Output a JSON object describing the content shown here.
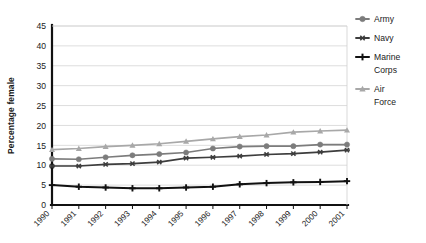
{
  "chart_data": {
    "type": "line",
    "title": "",
    "xlabel": "",
    "ylabel": "Percentage female",
    "ylim": [
      0,
      45
    ],
    "ytick_step": 5,
    "yticks": [
      0,
      5,
      10,
      15,
      20,
      25,
      30,
      35,
      40,
      45
    ],
    "grid": "horizontal",
    "legend_position": "right",
    "categories": [
      "1990",
      "1991",
      "1992",
      "1993",
      "1994",
      "1995",
      "1996",
      "1997",
      "1998",
      "1999",
      "2000",
      "2001"
    ],
    "series": [
      {
        "name": "Army",
        "color": "#7c7c7c",
        "marker": "circle",
        "values": [
          11.6,
          11.5,
          12.0,
          12.5,
          12.8,
          13.2,
          14.2,
          14.7,
          14.8,
          14.8,
          15.2,
          15.2
        ]
      },
      {
        "name": "Navy",
        "color": "#3d3d3d",
        "marker": "asterisk",
        "values": [
          9.8,
          9.8,
          10.2,
          10.4,
          10.8,
          11.8,
          12.0,
          12.3,
          12.7,
          12.9,
          13.3,
          13.8
        ]
      },
      {
        "name": "Marine Corps",
        "color": "#111111",
        "marker": "plus",
        "values": [
          5.0,
          4.6,
          4.4,
          4.2,
          4.2,
          4.4,
          4.6,
          5.2,
          5.5,
          5.7,
          5.8,
          6.0
        ]
      },
      {
        "name": "Air Force",
        "color": "#a8a8a8",
        "marker": "triangle",
        "values": [
          13.9,
          14.2,
          14.7,
          15.0,
          15.4,
          16.0,
          16.6,
          17.2,
          17.6,
          18.3,
          18.6,
          18.8
        ]
      }
    ]
  },
  "legend": {
    "entries": [
      {
        "label": "Army"
      },
      {
        "label": "Navy"
      },
      {
        "label": "Marine"
      },
      {
        "label": "Corps"
      },
      {
        "label": "Air"
      },
      {
        "label": "Force"
      }
    ]
  }
}
